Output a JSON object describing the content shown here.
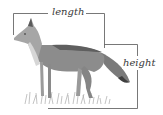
{
  "diagram": {
    "labels": {
      "length": "length",
      "height": "height"
    },
    "colors": {
      "line": "#555555",
      "fur_dark": "#6b6b6b",
      "fur_light": "#bdbdbd",
      "grass": "#9a9a9a"
    }
  }
}
